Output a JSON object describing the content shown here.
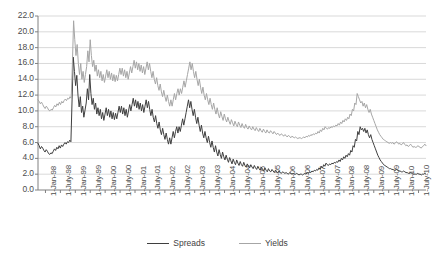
{
  "chart_data": {
    "type": "line",
    "title": "",
    "xlabel": "",
    "ylabel": "",
    "ylim": [
      0,
      22
    ],
    "ytick_step": 2,
    "grid": true,
    "legend_position": "bottom",
    "colors": {
      "spreads": "#3f3f3f",
      "yields": "#a6a6a6",
      "grid": "#d9d9d9",
      "axis": "#808080",
      "text": "#4d4d4d"
    },
    "yticks": [
      "0.0",
      "2.0",
      "4.0",
      "6.0",
      "8.0",
      "10.0",
      "12.0",
      "14.0",
      "16.0",
      "18.0",
      "20.0",
      "22.0"
    ],
    "xticks": [
      "1-Jan-98",
      "1-July-98",
      "1-Jan-99",
      "1-July-99",
      "1-Jan-00",
      "1-July-00",
      "1-Jan-01",
      "1-July-01",
      "1-Jan-02",
      "1-July-02",
      "1-Jan-03",
      "1-July-03",
      "1-Jan-04",
      "1-July-04",
      "1-Jan-05",
      "1-July-05",
      "1-Jan-06",
      "1-July-06",
      "1-Jan-07",
      "1-July-07",
      "1-Jan-08",
      "1-July-08",
      "1-Jan-09",
      "1-July-09",
      "1-Jan-10",
      "1-July-10"
    ],
    "x_start": "1-Jan-98",
    "x_end": "1-July-10",
    "series": [
      {
        "name": "Spreads",
        "color": "#3f3f3f",
        "values": [
          5.9,
          5.6,
          5.2,
          5.5,
          5.3,
          5.0,
          4.8,
          5.1,
          4.9,
          4.6,
          4.5,
          4.7,
          4.6,
          4.9,
          5.2,
          5.0,
          5.4,
          5.2,
          5.6,
          5.3,
          5.7,
          5.5,
          5.8,
          6.0,
          5.8,
          6.1,
          6.0,
          6.3,
          6.1,
          11.5,
          16.8,
          15.0,
          13.2,
          14.5,
          12.0,
          10.5,
          11.8,
          9.8,
          10.6,
          9.2,
          10.1,
          11.0,
          12.8,
          11.4,
          14.6,
          12.2,
          10.8,
          11.6,
          10.2,
          11.0,
          9.6,
          10.4,
          9.4,
          10.2,
          9.0,
          9.8,
          8.8,
          9.6,
          10.4,
          9.4,
          10.2,
          9.2,
          10.0,
          9.0,
          9.8,
          8.9,
          9.7,
          9.0,
          9.8,
          10.6,
          9.8,
          10.6,
          9.6,
          10.4,
          9.4,
          10.2,
          9.2,
          10.0,
          10.8,
          10.0,
          10.8,
          11.6,
          10.6,
          11.4,
          10.4,
          11.2,
          10.2,
          11.0,
          10.0,
          10.8,
          9.8,
          10.6,
          11.4,
          10.4,
          11.2,
          10.2,
          9.4,
          10.2,
          9.2,
          8.6,
          9.4,
          8.4,
          7.8,
          8.6,
          7.6,
          7.0,
          7.8,
          7.0,
          6.4,
          7.2,
          6.4,
          5.8,
          6.6,
          5.8,
          6.6,
          7.4,
          6.6,
          7.4,
          8.0,
          7.2,
          8.0,
          7.4,
          8.2,
          9.0,
          8.2,
          9.0,
          9.8,
          10.6,
          11.4,
          10.4,
          11.2,
          10.2,
          9.4,
          10.2,
          9.2,
          8.4,
          9.2,
          8.2,
          7.4,
          8.2,
          7.2,
          6.6,
          7.4,
          6.6,
          6.0,
          6.8,
          6.0,
          5.4,
          6.2,
          5.4,
          4.8,
          5.6,
          4.8,
          4.3,
          5.1,
          4.5,
          4.0,
          4.8,
          4.2,
          3.8,
          4.4,
          3.9,
          3.5,
          4.1,
          3.7,
          3.3,
          3.9,
          3.5,
          3.2,
          3.8,
          3.4,
          3.1,
          3.6,
          3.2,
          3.0,
          3.5,
          3.1,
          2.9,
          3.3,
          3.0,
          2.8,
          3.2,
          2.9,
          2.7,
          3.1,
          2.8,
          2.6,
          3.0,
          2.7,
          2.5,
          2.9,
          2.6,
          2.4,
          2.8,
          2.5,
          2.3,
          2.7,
          2.4,
          2.3,
          2.6,
          2.4,
          2.2,
          2.5,
          2.3,
          2.2,
          2.4,
          2.2,
          2.1,
          2.3,
          2.2,
          2.1,
          2.2,
          2.1,
          2.0,
          2.2,
          2.1,
          2.0,
          2.1,
          2.0,
          2.0,
          2.1,
          2.0,
          1.9,
          2.0,
          2.0,
          1.9,
          2.0,
          2.1,
          2.0,
          2.2,
          2.1,
          2.3,
          2.2,
          2.4,
          2.3,
          2.5,
          2.4,
          2.6,
          2.5,
          2.8,
          2.6,
          3.0,
          2.8,
          3.2,
          3.0,
          3.4,
          3.2,
          3.1,
          3.3,
          3.2,
          3.4,
          3.3,
          3.5,
          3.4,
          3.6,
          3.5,
          3.8,
          3.6,
          4.0,
          3.8,
          4.2,
          4.0,
          4.4,
          4.2,
          4.6,
          4.4,
          5.0,
          4.8,
          5.6,
          5.4,
          6.4,
          6.2,
          7.4,
          7.0,
          8.0,
          7.6,
          7.8,
          7.4,
          7.8,
          7.2,
          7.6,
          7.0,
          6.6,
          7.0,
          6.4,
          6.0,
          5.6,
          5.2,
          4.8,
          4.4,
          4.1,
          3.8,
          3.6,
          3.4,
          3.2,
          3.1,
          3.0,
          2.9,
          2.8,
          2.7,
          2.7,
          2.6,
          2.6,
          2.5,
          2.5,
          2.6,
          2.5,
          2.4,
          2.4,
          2.3,
          2.3,
          2.4,
          2.3,
          2.2,
          2.2,
          2.1,
          2.1,
          2.2,
          2.1,
          2.0,
          2.0,
          2.0,
          2.0,
          2.1,
          2.0,
          2.0,
          1.9,
          2.0,
          2.0,
          2.1,
          2.0
        ]
      },
      {
        "name": "Yields",
        "color": "#a6a6a6",
        "values": [
          11.4,
          11.2,
          10.9,
          11.1,
          10.8,
          10.5,
          10.3,
          10.6,
          10.4,
          10.1,
          10.0,
          10.2,
          10.1,
          10.4,
          10.7,
          10.5,
          10.9,
          10.7,
          11.1,
          10.8,
          11.2,
          11.0,
          11.3,
          11.5,
          11.3,
          11.6,
          11.5,
          11.8,
          11.6,
          16.0,
          21.4,
          19.0,
          17.0,
          18.4,
          16.0,
          14.6,
          16.0,
          14.0,
          15.0,
          13.6,
          14.6,
          15.6,
          17.6,
          16.2,
          19.0,
          17.0,
          15.6,
          16.4,
          15.0,
          15.8,
          14.4,
          15.2,
          14.2,
          15.0,
          13.8,
          14.6,
          13.6,
          14.4,
          15.2,
          14.2,
          15.0,
          14.0,
          14.8,
          13.8,
          14.6,
          13.7,
          14.5,
          13.8,
          14.6,
          15.4,
          14.6,
          15.4,
          14.4,
          15.2,
          14.2,
          15.0,
          14.0,
          14.8,
          15.6,
          14.8,
          15.6,
          16.4,
          15.4,
          16.2,
          15.2,
          16.0,
          15.0,
          15.8,
          14.8,
          15.6,
          14.6,
          15.4,
          16.2,
          15.2,
          16.0,
          15.0,
          14.2,
          15.0,
          14.0,
          13.4,
          14.2,
          13.2,
          12.6,
          13.4,
          12.4,
          11.8,
          12.6,
          11.8,
          11.2,
          12.0,
          11.2,
          10.6,
          11.4,
          10.6,
          11.4,
          12.2,
          11.4,
          12.2,
          12.8,
          12.0,
          12.8,
          12.2,
          13.0,
          13.8,
          13.0,
          13.8,
          14.6,
          15.4,
          16.2,
          15.2,
          16.0,
          15.0,
          14.2,
          15.0,
          14.0,
          13.2,
          14.0,
          13.0,
          12.2,
          13.0,
          12.0,
          11.4,
          12.2,
          11.4,
          10.8,
          11.6,
          10.8,
          10.2,
          11.0,
          10.2,
          9.6,
          10.4,
          9.6,
          9.1,
          9.9,
          9.3,
          8.8,
          9.6,
          9.0,
          8.6,
          9.2,
          8.7,
          8.3,
          8.9,
          8.5,
          8.1,
          8.7,
          8.3,
          8.0,
          8.6,
          8.2,
          7.9,
          8.4,
          8.0,
          7.8,
          8.3,
          7.9,
          7.7,
          8.1,
          7.8,
          7.6,
          8.0,
          7.7,
          7.5,
          7.9,
          7.6,
          7.4,
          7.8,
          7.5,
          7.3,
          7.7,
          7.4,
          7.2,
          7.6,
          7.3,
          7.2,
          7.5,
          7.3,
          7.1,
          7.4,
          7.2,
          7.0,
          7.2,
          7.0,
          6.9,
          7.1,
          7.0,
          6.8,
          7.0,
          6.9,
          6.7,
          6.9,
          6.8,
          6.6,
          6.8,
          6.7,
          6.6,
          6.7,
          6.6,
          6.5,
          6.6,
          6.6,
          6.5,
          6.6,
          6.7,
          6.6,
          6.8,
          6.7,
          6.9,
          6.8,
          7.0,
          6.9,
          7.1,
          7.0,
          7.2,
          7.1,
          7.4,
          7.2,
          7.6,
          7.4,
          7.8,
          7.6,
          8.0,
          7.8,
          7.7,
          7.9,
          7.8,
          8.0,
          7.9,
          8.1,
          8.0,
          8.2,
          8.1,
          8.4,
          8.2,
          8.6,
          8.4,
          8.8,
          8.6,
          9.0,
          8.8,
          9.2,
          9.0,
          9.6,
          9.4,
          10.2,
          10.0,
          11.0,
          10.8,
          12.2,
          11.8,
          11.4,
          11.0,
          11.2,
          10.6,
          11.0,
          10.4,
          10.8,
          10.2,
          9.8,
          10.2,
          9.6,
          9.2,
          8.8,
          8.4,
          8.0,
          7.6,
          7.3,
          7.0,
          6.8,
          6.6,
          6.4,
          6.3,
          6.2,
          6.1,
          6.0,
          5.9,
          6.0,
          5.9,
          6.0,
          5.8,
          5.9,
          6.1,
          6.0,
          5.8,
          5.9,
          5.7,
          5.8,
          6.0,
          5.8,
          5.6,
          5.7,
          5.5,
          5.6,
          5.8,
          5.6,
          5.4,
          5.5,
          5.4,
          5.4,
          5.6,
          5.5,
          5.4,
          5.3,
          5.5,
          5.6,
          5.8,
          5.6
        ]
      }
    ]
  }
}
